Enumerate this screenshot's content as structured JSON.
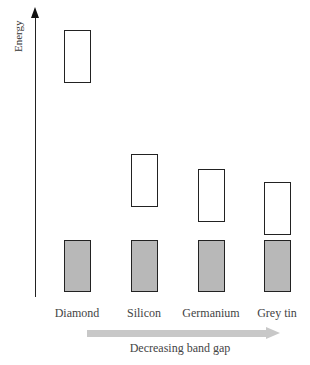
{
  "diagram": {
    "axis_label": "Energy",
    "materials": [
      {
        "name": "Diamond",
        "conduction_band": {
          "x": 64,
          "top": 30,
          "bottom": 83
        },
        "valence_band": {
          "x": 64,
          "top": 240,
          "bottom": 292
        }
      },
      {
        "name": "Silicon",
        "conduction_band": {
          "x": 131,
          "top": 154,
          "bottom": 207
        },
        "valence_band": {
          "x": 131,
          "top": 240,
          "bottom": 292
        }
      },
      {
        "name": "Germanium",
        "conduction_band": {
          "x": 198,
          "top": 169,
          "bottom": 222
        },
        "valence_band": {
          "x": 198,
          "top": 240,
          "bottom": 292
        }
      },
      {
        "name": "Grey tin",
        "conduction_band": {
          "x": 264,
          "top": 182,
          "bottom": 235
        },
        "valence_band": {
          "x": 264,
          "top": 240,
          "bottom": 292
        }
      }
    ],
    "arrow_label": "Decreasing band gap",
    "colors": {
      "valence_fill": "#b8b8b8",
      "conduction_fill": "#ffffff",
      "outline": "#222222",
      "arrow": "#c8c8c8"
    }
  }
}
